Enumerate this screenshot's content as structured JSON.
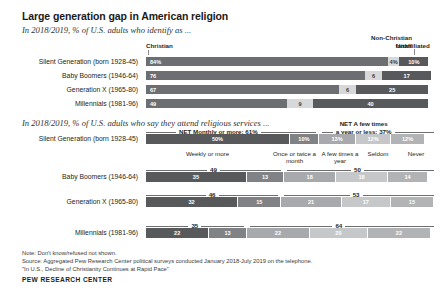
{
  "title": "Large generation gap in American religion",
  "chart1": {
    "subtitle": "In 2018/2019, % of U.S. adults who identify as ...",
    "headers": [
      "Christian",
      "Non-Christian faiths",
      "Unaffiliated"
    ],
    "rows": [
      {
        "label": "Silent Generation (born 1928-45)",
        "christian": "84%",
        "nonchristian": "4%",
        "unaffiliated": "10%"
      },
      {
        "label": "Baby Boomers (1946-64)",
        "christian": "76",
        "nonchristian": "6",
        "unaffiliated": "17"
      },
      {
        "label": "Generation X (1965-80)",
        "christian": "67",
        "nonchristian": "6",
        "unaffiliated": "25"
      },
      {
        "label": "Millennials (1981-96)",
        "christian": "49",
        "nonchristian": "9",
        "unaffiliated": "40"
      }
    ]
  },
  "chart2": {
    "subtitle": "In 2018/2019, % of U.S. adults who say they attend religious services ...",
    "net_left_label": "NET Monthly or more:",
    "net_right_label": "NET A few times a year or less:",
    "categories": [
      "Weekly or more",
      "Once or twice a month",
      "A few times a year",
      "Seldom",
      "Never"
    ],
    "rows": [
      {
        "label": "Silent Generation (born 1928-45)",
        "net_left": "61%",
        "net_right": "37%",
        "values": [
          "50%",
          "10%",
          "13%",
          "12%",
          "12%"
        ]
      },
      {
        "label": "Baby Boomers (1946-64)",
        "net_left": "49",
        "net_right": "50",
        "values": [
          "35",
          "13",
          "18",
          "18",
          "14"
        ]
      },
      {
        "label": "Generation X (1965-80)",
        "net_left": "46",
        "net_right": "53",
        "values": [
          "32",
          "15",
          "21",
          "17",
          "15"
        ]
      },
      {
        "label": "Millennials (1981-96)",
        "net_left": "35",
        "net_right": "64",
        "values": [
          "22",
          "13",
          "22",
          "20",
          "22"
        ]
      }
    ]
  },
  "footer": {
    "note": "Note: Don't know/refused not shown.",
    "source": "Source: Aggregated Pew Research Center political surveys conducted January 2018-July 2019 on the telephone.",
    "reference": "\"In U.S., Decline of Christianity Continues at Rapid Pace\"",
    "brand": "PEW RESEARCH CENTER"
  },
  "chart_data": [
    {
      "type": "bar",
      "title": "In 2018/2019, % of U.S. adults who identify as ...",
      "orientation": "horizontal-stacked",
      "categories": [
        "Silent Generation (born 1928-45)",
        "Baby Boomers (1946-64)",
        "Generation X (1965-80)",
        "Millennials (1981-96)"
      ],
      "series": [
        {
          "name": "Christian",
          "values": [
            84,
            76,
            67,
            49
          ]
        },
        {
          "name": "Non-Christian faiths",
          "values": [
            4,
            6,
            6,
            9
          ]
        },
        {
          "name": "Unaffiliated",
          "values": [
            10,
            17,
            25,
            40
          ]
        }
      ],
      "xlabel": "",
      "ylabel": "",
      "xlim": [
        0,
        100
      ],
      "grid": false,
      "legend": "top"
    },
    {
      "type": "bar",
      "title": "In 2018/2019, % of U.S. adults who say they attend religious services ...",
      "orientation": "horizontal-stacked",
      "categories": [
        "Silent Generation (born 1928-45)",
        "Baby Boomers (1946-64)",
        "Generation X (1965-80)",
        "Millennials (1981-96)"
      ],
      "series": [
        {
          "name": "Weekly or more",
          "values": [
            50,
            35,
            32,
            22
          ]
        },
        {
          "name": "Once or twice a month",
          "values": [
            10,
            13,
            15,
            13
          ]
        },
        {
          "name": "A few times a year",
          "values": [
            13,
            18,
            21,
            22
          ]
        },
        {
          "name": "Seldom",
          "values": [
            12,
            18,
            17,
            20
          ]
        },
        {
          "name": "Never",
          "values": [
            12,
            14,
            15,
            22
          ]
        }
      ],
      "annotations": [
        {
          "name": "NET Monthly or more",
          "values": [
            61,
            49,
            46,
            35
          ]
        },
        {
          "name": "NET A few times a year or less",
          "values": [
            37,
            50,
            53,
            64
          ]
        }
      ],
      "xlabel": "",
      "ylabel": "",
      "xlim": [
        0,
        100
      ],
      "grid": false,
      "legend": "bottom"
    }
  ]
}
